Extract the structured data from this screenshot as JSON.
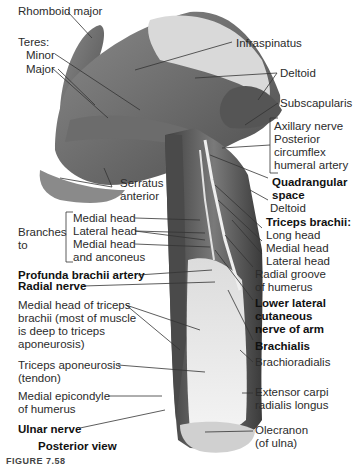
{
  "figure": {
    "view_label": "Posterior view",
    "caption_fragment": "FIGURE 7.58",
    "labels": {
      "rhomboid_major": "Rhomboid major",
      "teres": "Teres:",
      "teres_minor": "Minor",
      "teres_major": "Major",
      "infraspinatus": "Infraspinatus",
      "deltoid_top": "Deltoid",
      "subscapularis": "Subscapularis",
      "axillary_nerve": "Axillary nerve",
      "posterior_circumflex_1": "Posterior",
      "posterior_circumflex_2": "circumflex",
      "posterior_circumflex_3": "humeral artery",
      "quadrangular_space_1": "Quadrangular",
      "quadrangular_space_2": "space",
      "deltoid_lower": "Deltoid",
      "triceps_brachii": "Triceps brachii:",
      "long_head": "Long head",
      "medial_head_right": "Medial head",
      "lateral_head_right": "Lateral head",
      "radial_groove_1": "Radial groove",
      "radial_groove_2": "of humerus",
      "lower_lateral_1": "Lower lateral",
      "lower_lateral_2": "cutaneous",
      "lower_lateral_3": "nerve of arm",
      "brachialis": "Brachialis",
      "brachioradialis": "Brachioradialis",
      "extensor_1": "Extensor carpi",
      "extensor_2": "radialis longus",
      "olecranon_1": "Olecranon",
      "olecranon_2": "(of ulna)",
      "serratus_1": "Serratus",
      "serratus_2": "anterior",
      "branches_1": "Branches",
      "branches_2": "to",
      "branch_medial_head": "Medial head",
      "branch_lateral_head": "Lateral head",
      "branch_medial_anconeus_1": "Medial head",
      "branch_medial_anconeus_2": "and anconeus",
      "profunda": "Profunda brachii artery",
      "radial_nerve": "Radial nerve",
      "medial_head_triceps_1": "Medial head of triceps",
      "medial_head_triceps_2": "brachii (most of muscle",
      "medial_head_triceps_3": "is deep to triceps",
      "medial_head_triceps_4": "aponeurosis)",
      "triceps_apo_1": "Triceps aponeurosis",
      "triceps_apo_2": "(tendon)",
      "medial_epicondyle_1": "Medial epicondyle",
      "medial_epicondyle_2": "of humerus",
      "ulnar_nerve": "Ulnar nerve"
    }
  }
}
